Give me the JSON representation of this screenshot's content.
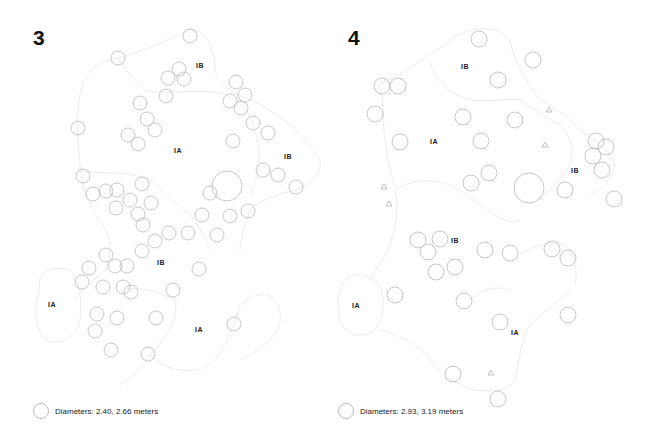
{
  "colors": {
    "circle_stroke": "#b9b9b9",
    "boundary_stroke": "#ececec",
    "triangle_stroke": "#aaaaaa",
    "text": "#222222"
  },
  "panels": [
    {
      "number": "3",
      "number_pos": [
        33,
        26
      ],
      "legend": {
        "text": "Diameters: 2.40, 2.66 meters",
        "pos": [
          33,
          403
        ]
      },
      "zones": [
        {
          "label": "IB",
          "x": 200,
          "y": 66
        },
        {
          "label": "IA",
          "x": 178,
          "y": 151
        },
        {
          "label": "IB",
          "x": 288,
          "y": 157
        },
        {
          "label": "IB",
          "x": 161,
          "y": 263
        },
        {
          "label": "IA",
          "x": 52,
          "y": 305
        },
        {
          "label": "IA",
          "x": 199,
          "y": 330
        }
      ],
      "boundaries": [
        "M118,58 C150,50 170,38 190,30 C200,28 215,40 215,70 C220,90 240,95 255,102 C280,115 300,130 320,160 C322,175 310,185 295,190 C275,195 260,200 250,210 C245,225 240,240 240,250",
        "M118,58 C100,60 85,70 80,95 C75,120 78,140 80,165 C82,185 85,200 95,210",
        "M118,58 C125,70 135,80 145,90 C160,95 185,90 215,92 C235,95 250,110 255,130 C260,150 262,170 250,195",
        "M80,170 C100,175 130,170 150,180 C165,190 175,205 190,215 C200,225 205,240 210,250",
        "M95,215 C110,230 115,250 105,270 C95,280 80,290 75,300",
        "M40,290 C35,270 55,265 70,270 C80,280 82,300 80,320 C75,340 60,345 45,340 C35,325 33,305 40,290",
        "M125,290 C140,285 165,295 175,300 C180,320 160,345 150,355 C170,375 200,375 215,360 C230,340 235,320 240,305 C250,295 265,290 275,300 C285,315 280,330 270,340 C260,350 250,355 240,360",
        "M150,355 C140,370 130,380 120,385"
      ],
      "circles": [
        {
          "cx": 190,
          "cy": 36,
          "r": 7
        },
        {
          "cx": 118,
          "cy": 58,
          "r": 7
        },
        {
          "cx": 179,
          "cy": 69,
          "r": 7
        },
        {
          "cx": 168,
          "cy": 78,
          "r": 7
        },
        {
          "cx": 184,
          "cy": 79,
          "r": 7
        },
        {
          "cx": 166,
          "cy": 96,
          "r": 7
        },
        {
          "cx": 140,
          "cy": 103,
          "r": 7
        },
        {
          "cx": 236,
          "cy": 82,
          "r": 7
        },
        {
          "cx": 245,
          "cy": 95,
          "r": 7
        },
        {
          "cx": 230,
          "cy": 101,
          "r": 7
        },
        {
          "cx": 241,
          "cy": 108,
          "r": 7
        },
        {
          "cx": 147,
          "cy": 119,
          "r": 7
        },
        {
          "cx": 155,
          "cy": 130,
          "r": 7
        },
        {
          "cx": 128,
          "cy": 135,
          "r": 7
        },
        {
          "cx": 138,
          "cy": 144,
          "r": 7
        },
        {
          "cx": 78,
          "cy": 128,
          "r": 7
        },
        {
          "cx": 253,
          "cy": 123,
          "r": 7
        },
        {
          "cx": 268,
          "cy": 133,
          "r": 7
        },
        {
          "cx": 233,
          "cy": 141,
          "r": 7
        },
        {
          "cx": 263,
          "cy": 170,
          "r": 7
        },
        {
          "cx": 278,
          "cy": 175,
          "r": 7
        },
        {
          "cx": 296,
          "cy": 187,
          "r": 7
        },
        {
          "cx": 227,
          "cy": 186,
          "r": 15
        },
        {
          "cx": 210,
          "cy": 193,
          "r": 7
        },
        {
          "cx": 248,
          "cy": 211,
          "r": 7
        },
        {
          "cx": 230,
          "cy": 216,
          "r": 7
        },
        {
          "cx": 83,
          "cy": 176,
          "r": 7
        },
        {
          "cx": 93,
          "cy": 194,
          "r": 7
        },
        {
          "cx": 106,
          "cy": 191,
          "r": 7
        },
        {
          "cx": 117,
          "cy": 190,
          "r": 7
        },
        {
          "cx": 142,
          "cy": 184,
          "r": 7
        },
        {
          "cx": 130,
          "cy": 200,
          "r": 7
        },
        {
          "cx": 151,
          "cy": 203,
          "r": 7
        },
        {
          "cx": 116,
          "cy": 208,
          "r": 7
        },
        {
          "cx": 138,
          "cy": 214,
          "r": 7
        },
        {
          "cx": 143,
          "cy": 225,
          "r": 7
        },
        {
          "cx": 202,
          "cy": 215,
          "r": 7
        },
        {
          "cx": 188,
          "cy": 233,
          "r": 7
        },
        {
          "cx": 169,
          "cy": 233,
          "r": 7
        },
        {
          "cx": 155,
          "cy": 241,
          "r": 7
        },
        {
          "cx": 142,
          "cy": 251,
          "r": 7
        },
        {
          "cx": 217,
          "cy": 235,
          "r": 7
        },
        {
          "cx": 106,
          "cy": 255,
          "r": 7
        },
        {
          "cx": 89,
          "cy": 268,
          "r": 7
        },
        {
          "cx": 115,
          "cy": 266,
          "r": 7
        },
        {
          "cx": 127,
          "cy": 266,
          "r": 7
        },
        {
          "cx": 82,
          "cy": 282,
          "r": 7
        },
        {
          "cx": 103,
          "cy": 287,
          "r": 7
        },
        {
          "cx": 123,
          "cy": 287,
          "r": 7
        },
        {
          "cx": 131,
          "cy": 292,
          "r": 7
        },
        {
          "cx": 199,
          "cy": 269,
          "r": 7
        },
        {
          "cx": 173,
          "cy": 290,
          "r": 7
        },
        {
          "cx": 97,
          "cy": 314,
          "r": 7
        },
        {
          "cx": 117,
          "cy": 318,
          "r": 7
        },
        {
          "cx": 156,
          "cy": 318,
          "r": 7
        },
        {
          "cx": 95,
          "cy": 331,
          "r": 7
        },
        {
          "cx": 234,
          "cy": 324,
          "r": 7
        },
        {
          "cx": 111,
          "cy": 350,
          "r": 7
        },
        {
          "cx": 148,
          "cy": 354,
          "r": 7
        }
      ],
      "triangles": []
    },
    {
      "number": "4",
      "number_pos": [
        348,
        26
      ],
      "legend": {
        "text": "Diameters: 2.93, 3.19 meters",
        "pos": [
          338,
          403
        ]
      },
      "zones": [
        {
          "label": "IB",
          "x": 465,
          "y": 67
        },
        {
          "label": "IA",
          "x": 434,
          "y": 142
        },
        {
          "label": "IB",
          "x": 575,
          "y": 171
        },
        {
          "label": "IB",
          "x": 455,
          "y": 241
        },
        {
          "label": "IA",
          "x": 356,
          "y": 306
        },
        {
          "label": "IA",
          "x": 515,
          "y": 333
        }
      ],
      "boundaries": [
        "M378,85 C400,75 425,60 450,40 C470,25 500,25 510,40 C515,65 525,80 540,100 C560,110 570,120 580,130 C595,140 610,150 615,165 C612,180 600,190 590,195",
        "M378,85 C385,95 382,120 385,140 C388,160 390,175 395,185",
        "M430,62 C435,80 450,95 470,100 C490,102 510,98 520,100 C535,110 550,120 560,125 C570,135 575,150 570,165 C560,180 550,190 540,200",
        "M395,190 C410,180 430,178 450,185 C470,195 480,205 495,215 C505,220 515,225 520,220",
        "M395,190 C400,210 395,230 388,250 C380,265 375,270 370,280",
        "M345,280 C355,270 370,275 380,285 C385,300 385,315 375,330 C360,340 345,335 340,320 C336,300 338,290 345,280",
        "M380,330 C400,335 420,345 430,360 C440,375 455,385 475,390 C495,392 510,390 515,380 C520,360 520,340 530,325 C545,310 560,300 570,290",
        "M520,255 C535,245 550,240 565,245 C575,255 578,270 575,285",
        "M470,300 C480,290 495,285 510,290"
      ],
      "circles": [
        {
          "cx": 479,
          "cy": 39,
          "r": 8
        },
        {
          "cx": 533,
          "cy": 60,
          "r": 8
        },
        {
          "cx": 382,
          "cy": 86,
          "r": 8
        },
        {
          "cx": 398,
          "cy": 86,
          "r": 8
        },
        {
          "cx": 498,
          "cy": 80,
          "r": 8
        },
        {
          "cx": 375,
          "cy": 114,
          "r": 8
        },
        {
          "cx": 463,
          "cy": 117,
          "r": 8
        },
        {
          "cx": 515,
          "cy": 120,
          "r": 8
        },
        {
          "cx": 400,
          "cy": 142,
          "r": 8
        },
        {
          "cx": 481,
          "cy": 141,
          "r": 8
        },
        {
          "cx": 596,
          "cy": 141,
          "r": 8
        },
        {
          "cx": 606,
          "cy": 147,
          "r": 8
        },
        {
          "cx": 593,
          "cy": 156,
          "r": 8
        },
        {
          "cx": 602,
          "cy": 170,
          "r": 8
        },
        {
          "cx": 489,
          "cy": 173,
          "r": 8
        },
        {
          "cx": 471,
          "cy": 183,
          "r": 8
        },
        {
          "cx": 529,
          "cy": 188,
          "r": 15
        },
        {
          "cx": 565,
          "cy": 190,
          "r": 8
        },
        {
          "cx": 614,
          "cy": 199,
          "r": 8
        },
        {
          "cx": 418,
          "cy": 240,
          "r": 8
        },
        {
          "cx": 440,
          "cy": 239,
          "r": 8
        },
        {
          "cx": 428,
          "cy": 252,
          "r": 8
        },
        {
          "cx": 485,
          "cy": 250,
          "r": 8
        },
        {
          "cx": 510,
          "cy": 253,
          "r": 8
        },
        {
          "cx": 552,
          "cy": 249,
          "r": 8
        },
        {
          "cx": 568,
          "cy": 258,
          "r": 8
        },
        {
          "cx": 436,
          "cy": 272,
          "r": 8
        },
        {
          "cx": 455,
          "cy": 267,
          "r": 8
        },
        {
          "cx": 395,
          "cy": 295,
          "r": 8
        },
        {
          "cx": 464,
          "cy": 301,
          "r": 8
        },
        {
          "cx": 500,
          "cy": 322,
          "r": 8
        },
        {
          "cx": 568,
          "cy": 315,
          "r": 8
        },
        {
          "cx": 453,
          "cy": 374,
          "r": 8
        },
        {
          "cx": 498,
          "cy": 399,
          "r": 8
        }
      ],
      "triangles": [
        {
          "x": 549,
          "y": 110
        },
        {
          "x": 545,
          "y": 145
        },
        {
          "x": 384,
          "y": 187
        },
        {
          "x": 389,
          "y": 204
        },
        {
          "x": 491,
          "y": 373
        }
      ]
    }
  ]
}
